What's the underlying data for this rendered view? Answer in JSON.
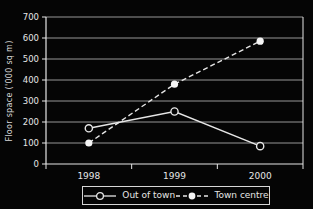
{
  "chart_data": {
    "type": "line",
    "title": "",
    "xlabel": "",
    "ylabel": "Floor space ('000 sq m)",
    "categories": [
      "1998",
      "1999",
      "2000"
    ],
    "series": [
      {
        "name": "Out of town",
        "values": [
          170,
          250,
          85
        ],
        "line_style": "solid",
        "marker": "open-circle"
      },
      {
        "name": "Town centre",
        "values": [
          100,
          380,
          585
        ],
        "line_style": "dashed",
        "marker": "filled-circle"
      }
    ],
    "ylim": [
      0,
      700
    ],
    "yticks": [
      0,
      100,
      200,
      300,
      400,
      500,
      600,
      700
    ],
    "grid": true,
    "legend_position": "bottom",
    "colors": {
      "background": "#050505",
      "foreground": "#e6e6e6",
      "gridline": "#a8a8a8",
      "marker_fill": "#f5f5f5"
    }
  }
}
